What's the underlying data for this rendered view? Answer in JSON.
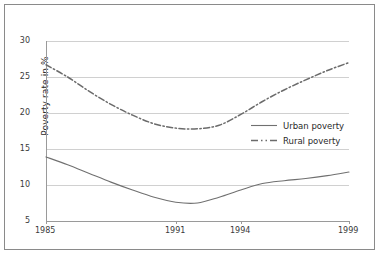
{
  "chart_data": {
    "type": "line",
    "title": "",
    "subtitle": "",
    "xlabel": "",
    "ylabel": "Poverty rate in %",
    "xlim": [
      1985,
      1999
    ],
    "ylim": [
      5,
      30
    ],
    "grid": true,
    "legend_position": "center-right",
    "x_tick_labels": [
      "1985",
      "1991",
      "1994",
      "1999"
    ],
    "x_ticks": [
      1985,
      1991,
      1994,
      1999
    ],
    "y_tick_labels": [
      "5",
      "10",
      "15",
      "20",
      "25",
      "30"
    ],
    "y_ticks": [
      5,
      10,
      15,
      20,
      25,
      30
    ],
    "x": [
      1985,
      1986,
      1987,
      1988,
      1989,
      1990,
      1991,
      1992,
      1993,
      1994,
      1995,
      1996,
      1997,
      1998,
      1999
    ],
    "series": [
      {
        "name": "Urban poverty",
        "style": "solid",
        "color": "#707070",
        "values": [
          13.9,
          12.8,
          11.6,
          10.4,
          9.3,
          8.3,
          7.6,
          7.5,
          8.3,
          9.3,
          10.2,
          10.6,
          10.9,
          11.3,
          11.8
        ]
      },
      {
        "name": "Rural poverty",
        "style": "dash-dot",
        "color": "#6b6b6b",
        "values": [
          26.7,
          25.0,
          23.0,
          21.2,
          19.7,
          18.5,
          17.9,
          17.8,
          18.3,
          19.8,
          21.6,
          23.2,
          24.6,
          25.9,
          27.0
        ]
      }
    ],
    "colors": {
      "urban": "#707070",
      "rural": "#6b6b6b",
      "gridline": "#d0d0d0",
      "axis": "#9a9a9a",
      "frame": "#8a8a8a",
      "background": "#ffffff",
      "text": "#2a2a2a"
    }
  },
  "legend": {
    "items": [
      {
        "label": "Urban poverty",
        "icon": "solid-line-icon"
      },
      {
        "label": "Rural poverty",
        "icon": "dash-dot-line-icon"
      }
    ]
  },
  "axes": {
    "y_title": "Poverty rate in %",
    "y_labels": {
      "t30": "30",
      "t25": "25",
      "t20": "20",
      "t15": "15",
      "t10": "10",
      "t5": "5"
    },
    "x_labels": {
      "x1985": "1985",
      "x1991": "1991",
      "x1994": "1994",
      "x1999": "1999"
    }
  }
}
